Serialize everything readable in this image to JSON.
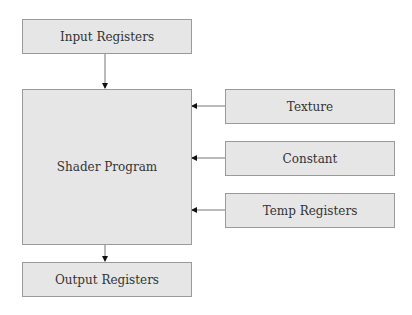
{
  "diagram": {
    "nodes": {
      "input_registers": {
        "label": "Input Registers"
      },
      "shader_program": {
        "label": "Shader Program"
      },
      "output_registers": {
        "label": "Output Registers"
      },
      "texture": {
        "label": "Texture"
      },
      "constant": {
        "label": "Constant"
      },
      "temp_registers": {
        "label": "Temp Registers"
      }
    },
    "edges": [
      {
        "from": "Input Registers",
        "to": "Shader Program"
      },
      {
        "from": "Texture",
        "to": "Shader Program"
      },
      {
        "from": "Constant",
        "to": "Shader Program"
      },
      {
        "from": "Temp Registers",
        "to": "Shader Program"
      },
      {
        "from": "Shader Program",
        "to": "Output Registers"
      }
    ],
    "colors": {
      "box_fill": "#e6e6e6",
      "box_border": "#9a9a9a",
      "line": "#777777"
    }
  }
}
